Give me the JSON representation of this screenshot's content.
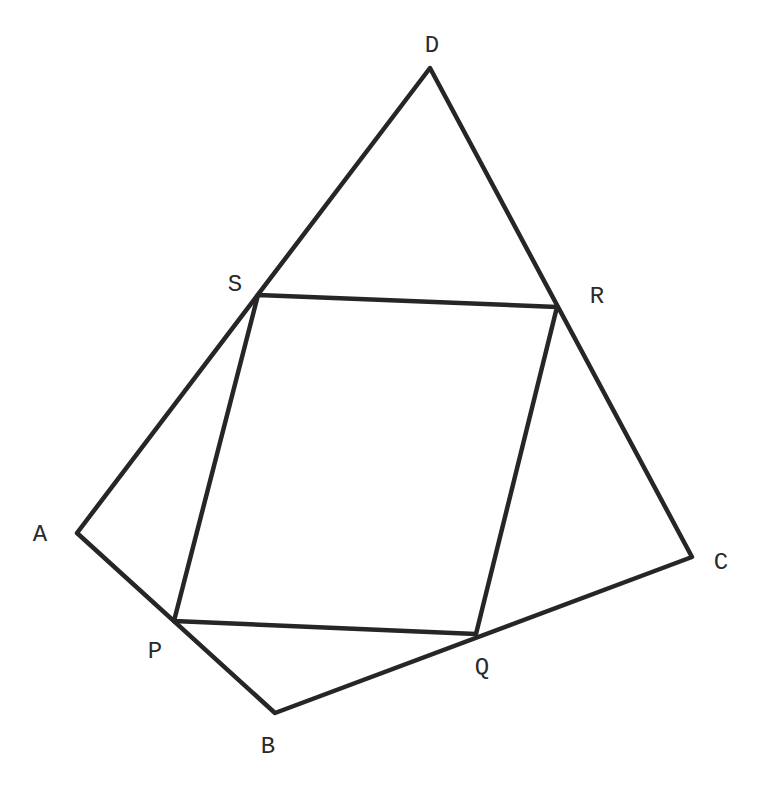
{
  "diagram": {
    "stroke_color": "#262626",
    "background": "#ffffff",
    "vertices": {
      "A": {
        "label": "A",
        "x": 77,
        "y": 533,
        "lx": 40,
        "ly": 534
      },
      "B": {
        "label": "B",
        "x": 275,
        "y": 713,
        "lx": 268,
        "ly": 746
      },
      "C": {
        "label": "C",
        "x": 692,
        "y": 557,
        "lx": 721,
        "ly": 562
      },
      "D": {
        "label": "D",
        "x": 430,
        "y": 68,
        "lx": 432,
        "ly": 45
      },
      "P": {
        "label": "P",
        "x": 174,
        "y": 621,
        "lx": 155,
        "ly": 651
      },
      "Q": {
        "label": "Q",
        "x": 476,
        "y": 634,
        "lx": 482,
        "ly": 667
      },
      "R": {
        "label": "R",
        "x": 557,
        "y": 307,
        "lx": 597,
        "ly": 296
      },
      "S": {
        "label": "S",
        "x": 258,
        "y": 295,
        "lx": 235,
        "ly": 284
      }
    },
    "outer_polygon": [
      "A",
      "B",
      "C",
      "D"
    ],
    "inner_polygon": [
      "P",
      "Q",
      "R",
      "S"
    ]
  }
}
